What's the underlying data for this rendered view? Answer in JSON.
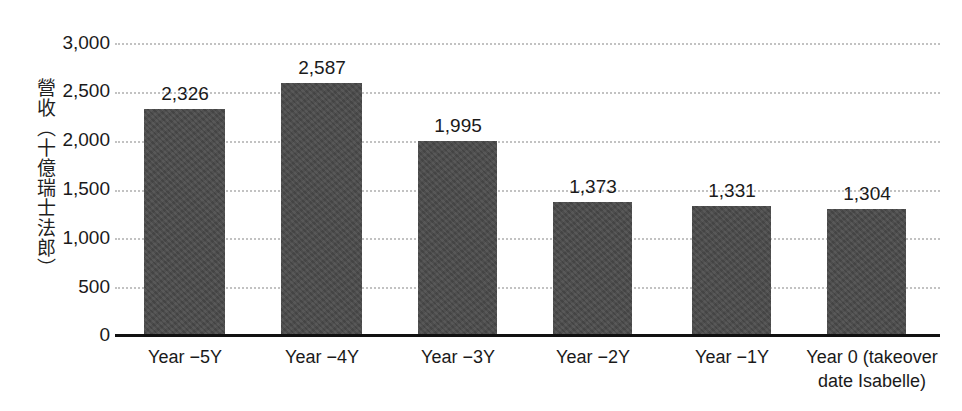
{
  "chart_data": {
    "type": "bar",
    "title": "",
    "subtitle": "",
    "xlabel": "",
    "ylabel": "營收（十億瑞士法郎）",
    "ylim": [
      0,
      3000
    ],
    "ytick_labels": [
      "3,000",
      "2,500",
      "2,000",
      "1,500",
      "1,000",
      "500",
      "0"
    ],
    "ytick_values": [
      3000,
      2500,
      2000,
      1500,
      1000,
      500,
      0
    ],
    "grid": true,
    "grid_style": "dotted",
    "legend": "none",
    "categories": [
      "Year −5Y",
      "Year −4Y",
      "Year −3Y",
      "Year −2Y",
      "Year −1Y",
      "Year 0 (takeover date Isabelle)"
    ],
    "category_label_lines": [
      [
        "Year −5Y"
      ],
      [
        "Year −4Y"
      ],
      [
        "Year −3Y"
      ],
      [
        "Year −2Y"
      ],
      [
        "Year −1Y"
      ],
      [
        "Year 0 (takeover",
        "date Isabelle)"
      ]
    ],
    "values": [
      2326,
      2587,
      1995,
      1373,
      1331,
      1304
    ],
    "value_labels": [
      "2,326",
      "2,587",
      "1,995",
      "1,373",
      "1,331",
      "1,304"
    ],
    "bar_color": "#4b4b4b",
    "grid_color": "#c2c2c2",
    "axis_color": "#111111",
    "text_color": "#1a1a1a",
    "background_color": "#ffffff"
  }
}
